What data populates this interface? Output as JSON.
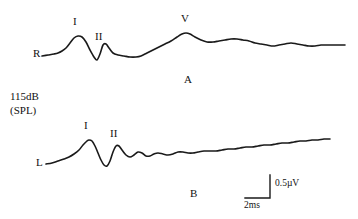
{
  "figure": {
    "background_color": "#ffffff",
    "trace_color": "#1a1a1a",
    "width": 358,
    "height": 219
  },
  "stimulus": {
    "level_line1": "115dB",
    "level_line2": "(SPL)"
  },
  "panels": [
    {
      "id": "A",
      "panel_label": "A",
      "ear_label": "R",
      "peak_labels": [
        "I",
        "II",
        "V"
      ]
    },
    {
      "id": "B",
      "panel_label": "B",
      "ear_label": "L",
      "peak_labels": [
        "I",
        "II"
      ]
    }
  ],
  "panel_a": {
    "label": "A",
    "ear": "R",
    "peak_i": "I",
    "peak_ii": "II",
    "peak_v": "V"
  },
  "panel_b": {
    "label": "B",
    "ear": "L",
    "peak_i": "I",
    "peak_ii": "II"
  },
  "scale_bar": {
    "amplitude": "0.5µV",
    "time": "2ms"
  },
  "chart_data": {
    "type": "line",
    "title": "",
    "subtitle": "",
    "xlabel": "Time (ms)",
    "ylabel": "Amplitude (µV)",
    "grid": false,
    "legend": "none",
    "annotations": [
      {
        "text": "115dB",
        "role": "stimulus-level"
      },
      {
        "text": "(SPL)",
        "role": "stimulus-level-units"
      },
      {
        "text": "A",
        "role": "panel-label"
      },
      {
        "text": "B",
        "role": "panel-label"
      },
      {
        "text": "R",
        "role": "trace-start-right-ear"
      },
      {
        "text": "L",
        "role": "trace-start-left-ear"
      },
      {
        "text": "0.5µV",
        "role": "scale-amplitude"
      },
      {
        "text": "2ms",
        "role": "scale-time"
      }
    ],
    "scale_bar": {
      "amplitude_uv": 0.5,
      "time_ms": 2
    },
    "series": [
      {
        "name": "A",
        "ear": "right",
        "start_marker": "R",
        "peaks": [
          {
            "label": "I",
            "x_px": 78,
            "y_px": 36
          },
          {
            "label": "II",
            "x_px": 102,
            "y_px": 44
          },
          {
            "label": "V",
            "x_px": 185,
            "y_px": 33
          }
        ],
        "points_px": [
          [
            42,
            56
          ],
          [
            48,
            55
          ],
          [
            54,
            54
          ],
          [
            58,
            53
          ],
          [
            62,
            51
          ],
          [
            66,
            48
          ],
          [
            70,
            43
          ],
          [
            74,
            38
          ],
          [
            78,
            36
          ],
          [
            82,
            37
          ],
          [
            86,
            42
          ],
          [
            90,
            50
          ],
          [
            94,
            57
          ],
          [
            97,
            60
          ],
          [
            100,
            54
          ],
          [
            103,
            45
          ],
          [
            106,
            44
          ],
          [
            109,
            48
          ],
          [
            113,
            53
          ],
          [
            118,
            55
          ],
          [
            124,
            56
          ],
          [
            130,
            57
          ],
          [
            136,
            57
          ],
          [
            141,
            56
          ],
          [
            147,
            53
          ],
          [
            153,
            50
          ],
          [
            159,
            47
          ],
          [
            165,
            44
          ],
          [
            171,
            41
          ],
          [
            177,
            37
          ],
          [
            182,
            34
          ],
          [
            186,
            33
          ],
          [
            190,
            34
          ],
          [
            195,
            37
          ],
          [
            201,
            40
          ],
          [
            207,
            42
          ],
          [
            213,
            42
          ],
          [
            219,
            41
          ],
          [
            225,
            40
          ],
          [
            231,
            39
          ],
          [
            237,
            39
          ],
          [
            243,
            40
          ],
          [
            249,
            41
          ],
          [
            255,
            43
          ],
          [
            261,
            44
          ],
          [
            267,
            45
          ],
          [
            273,
            46
          ],
          [
            279,
            45
          ],
          [
            285,
            44
          ],
          [
            291,
            43
          ],
          [
            297,
            44
          ],
          [
            303,
            45
          ],
          [
            309,
            46
          ],
          [
            315,
            46
          ],
          [
            321,
            45
          ],
          [
            327,
            45
          ],
          [
            333,
            45
          ],
          [
            339,
            45
          ],
          [
            345,
            45
          ]
        ]
      },
      {
        "name": "B",
        "ear": "left",
        "start_marker": "L",
        "peaks": [
          {
            "label": "I",
            "x_px": 89,
            "y_px": 140
          },
          {
            "label": "II",
            "x_px": 116,
            "y_px": 146
          }
        ],
        "points_px": [
          [
            46,
            164
          ],
          [
            52,
            163
          ],
          [
            58,
            161
          ],
          [
            64,
            159
          ],
          [
            69,
            157
          ],
          [
            74,
            154
          ],
          [
            79,
            150
          ],
          [
            83,
            145
          ],
          [
            87,
            141
          ],
          [
            89,
            140
          ],
          [
            92,
            141
          ],
          [
            95,
            146
          ],
          [
            98,
            153
          ],
          [
            101,
            160
          ],
          [
            104,
            165
          ],
          [
            107,
            166
          ],
          [
            110,
            161
          ],
          [
            113,
            152
          ],
          [
            116,
            146
          ],
          [
            119,
            146
          ],
          [
            122,
            150
          ],
          [
            126,
            155
          ],
          [
            130,
            157
          ],
          [
            134,
            155
          ],
          [
            138,
            152
          ],
          [
            142,
            153
          ],
          [
            146,
            156
          ],
          [
            150,
            156
          ],
          [
            154,
            154
          ],
          [
            158,
            153
          ],
          [
            163,
            154
          ],
          [
            168,
            155
          ],
          [
            173,
            154
          ],
          [
            178,
            152
          ],
          [
            183,
            152
          ],
          [
            188,
            153
          ],
          [
            193,
            153
          ],
          [
            198,
            152
          ],
          [
            204,
            151
          ],
          [
            210,
            151
          ],
          [
            216,
            151
          ],
          [
            222,
            150
          ],
          [
            228,
            149
          ],
          [
            234,
            149
          ],
          [
            240,
            148
          ],
          [
            246,
            147
          ],
          [
            252,
            147
          ],
          [
            258,
            146
          ],
          [
            264,
            145
          ],
          [
            270,
            145
          ],
          [
            276,
            144
          ],
          [
            282,
            143
          ],
          [
            288,
            143
          ],
          [
            294,
            142
          ],
          [
            300,
            141
          ],
          [
            306,
            141
          ],
          [
            312,
            140
          ],
          [
            318,
            140
          ],
          [
            324,
            139
          ],
          [
            330,
            139
          ]
        ]
      }
    ]
  }
}
